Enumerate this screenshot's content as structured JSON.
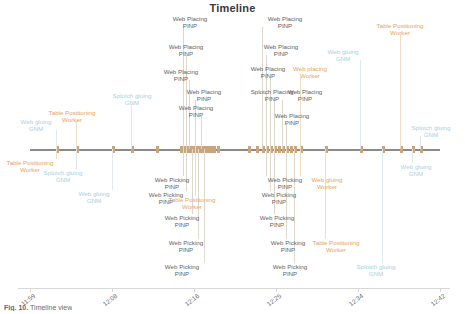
{
  "chart": {
    "title": "Timeline",
    "caption_bold": "Fig. 10.",
    "caption_rest": "Timeline view"
  },
  "chart_data": {
    "type": "timeline",
    "title": "Timeline",
    "xlabel": "",
    "ylabel": "",
    "grid": false,
    "legend": "none",
    "axis_ticks": [
      "11:59",
      "12:08",
      "12:16",
      "12:25",
      "12:34",
      "12:42"
    ],
    "axis_tick_positions": [
      30,
      112,
      194,
      276,
      358,
      440
    ],
    "xlim": [
      "11:59",
      "12:42"
    ],
    "colors": {
      "marker": "#c9a57e",
      "axis_line": "#8a8a8a",
      "label_gray": "#5f5f5f",
      "label_blue": "#a9cfe0",
      "label_orange": "#e3a45c",
      "tick_label": "#6d6d6d",
      "title": "#3a3a3a"
    },
    "markers_x": [
      56,
      76,
      112,
      131,
      156,
      180,
      183,
      186,
      189,
      192,
      195,
      198,
      201,
      204,
      207,
      210,
      213,
      217,
      248,
      256,
      262,
      266,
      270,
      274,
      278,
      282,
      286,
      290,
      294,
      300,
      325,
      360,
      382,
      400,
      412,
      420
    ],
    "events": [
      {
        "id": 1,
        "name": "Web gluing",
        "sub": "GNM",
        "color": "blue",
        "x": 36,
        "y": 118,
        "anchor_x": 56,
        "side": "above"
      },
      {
        "id": 2,
        "name": "Table Positioning",
        "sub": "Worker",
        "color": "orange",
        "x": 72,
        "y": 109,
        "anchor_x": 76,
        "side": "above"
      },
      {
        "id": 3,
        "name": "Table Positioning",
        "sub": "Worker",
        "color": "orange",
        "x": 30,
        "y": 159,
        "anchor_x": 56,
        "side": "below"
      },
      {
        "id": 4,
        "name": "Splotch gluing",
        "sub": "GNM",
        "color": "blue",
        "x": 63,
        "y": 169,
        "anchor_x": 76,
        "side": "below"
      },
      {
        "id": 5,
        "name": "Web gluing",
        "sub": "GNM",
        "color": "blue",
        "x": 94,
        "y": 190,
        "anchor_x": 112,
        "side": "below"
      },
      {
        "id": 6,
        "name": "Splotch gluing",
        "sub": "GNM",
        "color": "blue",
        "x": 132,
        "y": 92,
        "anchor_x": 131,
        "side": "above"
      },
      {
        "id": 7,
        "name": "Web Placing",
        "sub": "PINP",
        "color": "gray",
        "x": 190,
        "y": 15,
        "anchor_x": 183,
        "side": "above"
      },
      {
        "id": 8,
        "name": "Web Placing",
        "sub": "PINP",
        "color": "gray",
        "x": 186,
        "y": 43,
        "anchor_x": 186,
        "side": "above"
      },
      {
        "id": 9,
        "name": "Web Placing",
        "sub": "PINP",
        "color": "gray",
        "x": 181,
        "y": 68,
        "anchor_x": 189,
        "side": "above"
      },
      {
        "id": 10,
        "name": "Web Placing",
        "sub": "PINP",
        "color": "gray",
        "x": 204,
        "y": 88,
        "anchor_x": 195,
        "side": "above"
      },
      {
        "id": 11,
        "name": "Web Placing",
        "sub": "PINP",
        "color": "gray",
        "x": 196,
        "y": 104,
        "anchor_x": 201,
        "side": "above"
      },
      {
        "id": 12,
        "name": "Web Picking",
        "sub": "PINP",
        "color": "gray",
        "x": 172,
        "y": 176,
        "anchor_x": 183,
        "side": "below"
      },
      {
        "id": 13,
        "name": "Web Picking",
        "sub": "PINP",
        "color": "gray",
        "x": 166,
        "y": 191,
        "anchor_x": 186,
        "side": "below"
      },
      {
        "id": 14,
        "name": "Table Positioning",
        "sub": "Worker",
        "color": "orange",
        "x": 192,
        "y": 196,
        "anchor_x": 195,
        "side": "below"
      },
      {
        "id": 15,
        "name": "Web Picking",
        "sub": "PINP",
        "color": "gray",
        "x": 182,
        "y": 214,
        "anchor_x": 192,
        "side": "below"
      },
      {
        "id": 16,
        "name": "Web Picking",
        "sub": "PINP",
        "color": "gray",
        "x": 186,
        "y": 239,
        "anchor_x": 198,
        "side": "below"
      },
      {
        "id": 17,
        "name": "Web Picking",
        "sub": "PINP",
        "color": "gray",
        "x": 182,
        "y": 263,
        "anchor_x": 204,
        "side": "below"
      },
      {
        "id": 18,
        "name": "Web Placing",
        "sub": "PINP",
        "color": "gray",
        "x": 285,
        "y": 15,
        "anchor_x": 262,
        "side": "above"
      },
      {
        "id": 19,
        "name": "Web Placing",
        "sub": "PINP",
        "color": "gray",
        "x": 281,
        "y": 43,
        "anchor_x": 266,
        "side": "above"
      },
      {
        "id": 20,
        "name": "Web Placing",
        "sub": "PINP",
        "color": "gray",
        "x": 268,
        "y": 65,
        "anchor_x": 270,
        "side": "above"
      },
      {
        "id": 21,
        "name": "Web placing",
        "sub": "Worker",
        "color": "orange",
        "x": 310,
        "y": 65,
        "anchor_x": 300,
        "side": "above"
      },
      {
        "id": 22,
        "name": "Splotch Placing",
        "sub": "PINP",
        "color": "gray",
        "x": 272,
        "y": 88,
        "anchor_x": 274,
        "side": "above"
      },
      {
        "id": 23,
        "name": "Web Placing",
        "sub": "PINP",
        "color": "gray",
        "x": 305,
        "y": 88,
        "anchor_x": 282,
        "side": "above"
      },
      {
        "id": 24,
        "name": "Web Placing",
        "sub": "PINP",
        "color": "gray",
        "x": 292,
        "y": 112,
        "anchor_x": 286,
        "side": "above"
      },
      {
        "id": 25,
        "name": "Web gluing",
        "sub": "GNM",
        "color": "blue",
        "x": 343,
        "y": 48,
        "anchor_x": 360,
        "side": "above"
      },
      {
        "id": 26,
        "name": "Table Positioning",
        "sub": "Worker",
        "color": "orange",
        "x": 400,
        "y": 22,
        "anchor_x": 400,
        "side": "above"
      },
      {
        "id": 27,
        "name": "Splotch gluing",
        "sub": "GNM",
        "color": "blue",
        "x": 431,
        "y": 124,
        "anchor_x": 420,
        "side": "above"
      },
      {
        "id": 28,
        "name": "Web gluing",
        "sub": "GNM",
        "color": "blue",
        "x": 416,
        "y": 163,
        "anchor_x": 412,
        "side": "below"
      },
      {
        "id": 29,
        "name": "Web Picking",
        "sub": "PINP",
        "color": "gray",
        "x": 285,
        "y": 176,
        "anchor_x": 266,
        "side": "below"
      },
      {
        "id": 30,
        "name": "Web gluing",
        "sub": "Worker",
        "color": "orange",
        "x": 327,
        "y": 176,
        "anchor_x": 300,
        "side": "below"
      },
      {
        "id": 31,
        "name": "Web Picking",
        "sub": "PINP",
        "color": "gray",
        "x": 279,
        "y": 191,
        "anchor_x": 270,
        "side": "below"
      },
      {
        "id": 32,
        "name": "Web Picking",
        "sub": "PINP",
        "color": "gray",
        "x": 277,
        "y": 214,
        "anchor_x": 274,
        "side": "below"
      },
      {
        "id": 33,
        "name": "Table Positioning",
        "sub": "Worker",
        "color": "orange",
        "x": 336,
        "y": 239,
        "anchor_x": 325,
        "side": "below"
      },
      {
        "id": 34,
        "name": "Web Picking",
        "sub": "PINP",
        "color": "gray",
        "x": 288,
        "y": 239,
        "anchor_x": 286,
        "side": "below"
      },
      {
        "id": 35,
        "name": "Web Picking",
        "sub": "PINP",
        "color": "gray",
        "x": 290,
        "y": 263,
        "anchor_x": 294,
        "side": "below"
      },
      {
        "id": 36,
        "name": "Splotch gluing",
        "sub": "GNM",
        "color": "blue",
        "x": 376,
        "y": 263,
        "anchor_x": 382,
        "side": "below"
      }
    ]
  }
}
